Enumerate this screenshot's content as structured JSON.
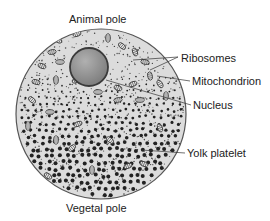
{
  "labels": {
    "animal_pole": "Animal pole",
    "vegetal_pole": "Vegetal pole",
    "ribosomes": "Ribosomes",
    "mitochondrion": "Mitochondrion",
    "nucleus": "Nucleus",
    "yolk_platelet": "Yolk platelet"
  },
  "colors": {
    "cytoplasm": "#d9d9d9",
    "outline": "#555555",
    "nucleus_fill": "#8f8f8f",
    "nucleus_edge": "#3a3a3a",
    "yolk": "#2a2a2a",
    "text": "#222222",
    "leader_line": "#333333"
  }
}
